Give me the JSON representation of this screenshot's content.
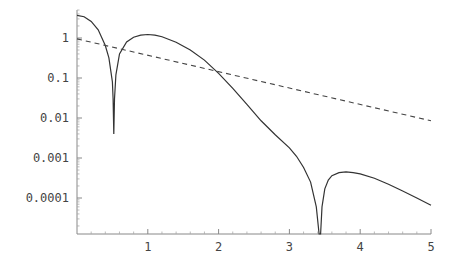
{
  "chart_data": {
    "type": "line",
    "title": "",
    "xlabel": "",
    "ylabel": "",
    "xscale": "linear",
    "yscale": "log",
    "xlim": [
      0,
      5
    ],
    "ylim": [
      1.2e-05,
      6
    ],
    "grid": false,
    "legend": null,
    "x_ticks": [
      1,
      2,
      3,
      4,
      5
    ],
    "x_tick_labels": [
      "1",
      "2",
      "3",
      "4",
      "5"
    ],
    "y_ticks": [
      1,
      0.1,
      0.01,
      0.001,
      0.0001
    ],
    "y_tick_labels": [
      "1",
      "0.1",
      "0.01",
      "0.001",
      "0.0001"
    ],
    "series": [
      {
        "name": "solid",
        "style": "solid",
        "color": "#333333",
        "x": [
          0,
          0.1,
          0.2,
          0.3,
          0.4,
          0.45,
          0.5,
          0.51,
          0.52,
          0.53,
          0.55,
          0.6,
          0.7,
          0.8,
          0.9,
          1.0,
          1.1,
          1.2,
          1.4,
          1.6,
          1.8,
          2.0,
          2.2,
          2.4,
          2.6,
          2.8,
          3.0,
          3.1,
          3.2,
          3.3,
          3.38,
          3.42,
          3.44,
          3.46,
          3.5,
          3.55,
          3.6,
          3.7,
          3.8,
          3.9,
          4.0,
          4.2,
          4.4,
          4.6,
          4.8,
          5.0
        ],
        "y": [
          3.7,
          3.4,
          2.6,
          1.6,
          0.65,
          0.32,
          0.08,
          0.03,
          0.004,
          0.03,
          0.12,
          0.4,
          0.8,
          1.05,
          1.18,
          1.22,
          1.18,
          1.08,
          0.78,
          0.5,
          0.28,
          0.13,
          0.055,
          0.022,
          0.0085,
          0.0038,
          0.0018,
          0.0011,
          0.00058,
          0.00025,
          6e-05,
          8e-06,
          1.2e-05,
          6e-05,
          0.00017,
          0.00028,
          0.00036,
          0.00043,
          0.00045,
          0.00043,
          0.0004,
          0.00031,
          0.00022,
          0.00015,
          0.0001,
          6.6e-05
        ]
      },
      {
        "name": "dashed",
        "style": "dashed",
        "color": "#444444",
        "x": [
          0,
          5
        ],
        "y": [
          0.95,
          0.0085
        ]
      }
    ]
  },
  "layout": {
    "plot_left": 77,
    "plot_right": 431,
    "axis_y": 234,
    "y_decade_px": 40,
    "y_one_px": 38,
    "plot_top": 10
  }
}
